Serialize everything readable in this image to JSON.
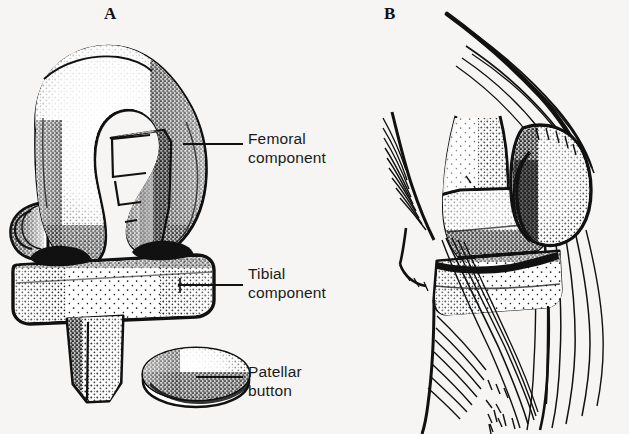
{
  "figure": {
    "background_color": "#f6f5f3",
    "ink_color": "#111111",
    "width": 629,
    "height": 434
  },
  "panels": [
    {
      "letter": "A",
      "name": "exploded-components-view",
      "description": "Exploded view of the three prosthetic components"
    },
    {
      "letter": "B",
      "name": "implanted-lateral-view",
      "description": "Lateral view of the knee with components implanted"
    }
  ],
  "callouts": [
    {
      "name": "femoral-component",
      "line1": "Femoral",
      "line2": "component",
      "leader": {
        "x1": 183,
        "y1": 144,
        "x2": 243,
        "y2": 144
      }
    },
    {
      "name": "tibial-component",
      "line1": "Tibial",
      "line2": "component",
      "leader": {
        "x1": 178,
        "y1": 285,
        "x2": 243,
        "y2": 285
      }
    },
    {
      "name": "patellar-button",
      "line1": "Patellar",
      "line2": "button",
      "leader": {
        "x1": 196,
        "y1": 377,
        "x2": 243,
        "y2": 377
      }
    }
  ]
}
